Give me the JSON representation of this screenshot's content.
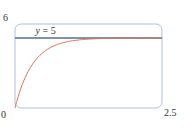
{
  "chart_data": {
    "type": "line",
    "title": "",
    "xlabel": "",
    "ylabel": "",
    "xlim": [
      0,
      2.5
    ],
    "ylim": [
      0,
      6
    ],
    "grid": false,
    "x_tick_labels": {
      "min": "0",
      "max": "2.5"
    },
    "y_tick_labels": {
      "max": "6"
    },
    "series": [
      {
        "name": "curve",
        "color": "#e0735a",
        "function": "y = 5(1 - e^(-3.3x))",
        "x": [
          0,
          0.125,
          0.25,
          0.375,
          0.5,
          0.625,
          0.75,
          0.875,
          1.0,
          1.25,
          1.5,
          1.75,
          2.0,
          2.25,
          2.5
        ],
        "y": [
          0,
          1.69,
          2.81,
          3.55,
          4.04,
          4.36,
          4.58,
          4.72,
          4.82,
          4.92,
          4.96,
          4.98,
          4.99,
          5.0,
          5.0
        ]
      },
      {
        "name": "asymptote",
        "color": "#5a6f8a",
        "x": [
          0,
          2.5
        ],
        "y": [
          5,
          5
        ]
      }
    ],
    "annotations": [
      {
        "text_var": "y",
        "text_rest": " = 5",
        "x": 0.35,
        "y": 5.3
      }
    ],
    "frame_color": "#a9c4dc"
  }
}
